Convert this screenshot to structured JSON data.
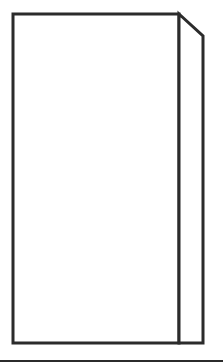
{
  "canvas": {
    "width": 223,
    "height": 364,
    "background": "#ffffff"
  },
  "stroke": {
    "color": "#2b2b2b",
    "box_width": 3,
    "floor_width": 2
  },
  "diagram": {
    "front_face": {
      "x": 13,
      "y": 14,
      "width": 166,
      "height": 329
    },
    "side_face": {
      "points": [
        [
          179,
          14
        ],
        [
          203,
          36
        ],
        [
          203,
          343
        ],
        [
          179,
          343
        ]
      ]
    },
    "floor_line": {
      "x1": 0,
      "y1": 361,
      "x2": 223,
      "y2": 361
    }
  }
}
